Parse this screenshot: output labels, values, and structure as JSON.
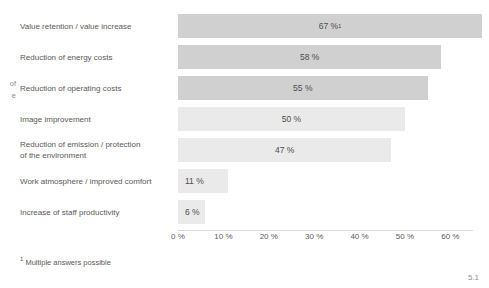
{
  "left_fragment": {
    "line1": "of",
    "line2": "e"
  },
  "footnote": {
    "marker": "1",
    "text": " Multiple answers possible"
  },
  "page_number": "5.1",
  "colors": {
    "bar_dark": "#d0d0d0",
    "bar_light": "#eaeaea",
    "grid": "#ffffff",
    "text": "#595959"
  },
  "chart_data": {
    "type": "bar",
    "orientation": "horizontal",
    "title": "",
    "xlabel": "",
    "ylabel": "",
    "xlim": [
      0,
      65
    ],
    "grid": true,
    "legend": false,
    "categories": [
      "Value retention / value increase",
      "Reduction of energy costs",
      "Reduction of operating costs",
      "Image improvement",
      "Reduction of emission / protection of the environment",
      "Work atmosphere / improved comfort",
      "Increase of staff productivity"
    ],
    "values": [
      67,
      58,
      55,
      50,
      47,
      11,
      6
    ],
    "value_labels": [
      "67 %",
      "58 %",
      "55 %",
      "50 %",
      "47 %",
      "11 %",
      "6 %"
    ],
    "ticks": [
      "0 %",
      "10 %",
      "20 %",
      "30 %",
      "40 %",
      "50 %",
      "60 %"
    ],
    "tick_values": [
      0,
      10,
      20,
      30,
      40,
      50,
      60
    ],
    "rows": [
      {
        "label_line1": "Value retention / value increase",
        "label_line2": "",
        "value": 67,
        "label": "67 %",
        "superscript": "1",
        "shade": "dark",
        "inside": true
      },
      {
        "label_line1": "Reduction of energy costs",
        "label_line2": "",
        "value": 58,
        "label": "58 %",
        "superscript": "",
        "shade": "dark",
        "inside": true
      },
      {
        "label_line1": "Reduction of operating costs",
        "label_line2": "",
        "value": 55,
        "label": "55 %",
        "superscript": "",
        "shade": "dark",
        "inside": true
      },
      {
        "label_line1": "Image improvement",
        "label_line2": "",
        "value": 50,
        "label": "50 %",
        "superscript": "",
        "shade": "light",
        "inside": true
      },
      {
        "label_line1": "Reduction of emission / protection",
        "label_line2": "of the environment",
        "value": 47,
        "label": "47 %",
        "superscript": "",
        "shade": "light",
        "inside": true
      },
      {
        "label_line1": "Work atmosphere / improved comfort",
        "label_line2": "",
        "value": 11,
        "label": "11 %",
        "superscript": "",
        "shade": "light",
        "inside": true
      },
      {
        "label_line1": "Increase of staff productivity",
        "label_line2": "",
        "value": 6,
        "label": "6 %",
        "superscript": "",
        "shade": "light",
        "inside": true
      }
    ]
  }
}
